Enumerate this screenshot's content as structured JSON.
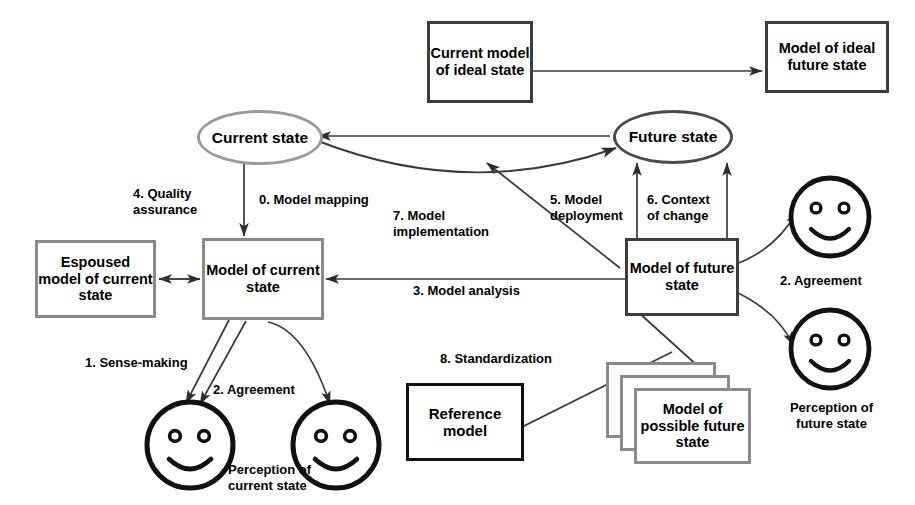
{
  "diagram": {
    "nodes": {
      "current_model_ideal": "Current model of ideal state",
      "model_ideal_future": "Model of ideal future state",
      "current_state": "Current state",
      "future_state": "Future state",
      "espoused_model": "Espoused model of current state",
      "model_current_state": "Model of current state",
      "model_future_state": "Model of future state",
      "reference_model": "Reference model",
      "model_possible_future": "Model of possible future state"
    },
    "edge_labels": {
      "step0": "0. Model mapping",
      "step1": "1. Sense-making",
      "step2_left": "2. Agreement",
      "step2_right": "2. Agreement",
      "step3": "3. Model analysis",
      "step4": "4. Quality assurance",
      "step5": "5. Model deployment",
      "step6": "6. Context of change",
      "step7": "7. Model implementation",
      "step8": "8. Standardization"
    },
    "captions": {
      "perception_current": "Perception of current state",
      "perception_future": "Perception of future state"
    },
    "colors": {
      "gray_border": "#8a8a8a",
      "dark_border": "#3d3d3d",
      "black_border": "#111111",
      "line": "#3a3a3a",
      "background": "#ffffff"
    }
  }
}
